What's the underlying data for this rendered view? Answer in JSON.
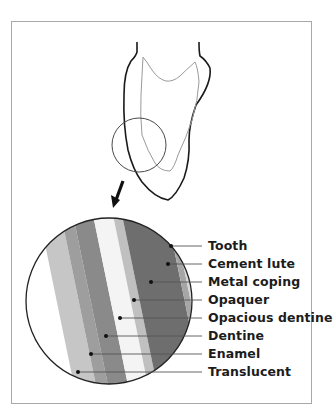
{
  "figure": {
    "colors": {
      "frame": "#a8a8a8",
      "tooth_outline": "#1a1a1a",
      "inner_outline": "#9a9a9a",
      "magnifier": "#4a4a4a",
      "white": "#ffffff",
      "light_gray": "#c6c6c6",
      "mid_gray": "#9e9e9e",
      "medium_dark_gray": "#8a8a8a",
      "dark_gray": "#6e6e6e",
      "label_text": "#1c1c1c"
    },
    "labels": [
      {
        "text": "Tooth",
        "dot": [
          171,
          246
        ],
        "y": 246
      },
      {
        "text": "Cement lute",
        "dot": [
          168,
          264
        ],
        "y": 264
      },
      {
        "text": "Metal coping",
        "dot": [
          151,
          282
        ],
        "y": 282
      },
      {
        "text": "Opaquer",
        "dot": [
          134,
          300
        ],
        "y": 300
      },
      {
        "text": "Opacious dentine",
        "dot": [
          120,
          318
        ],
        "y": 318
      },
      {
        "text": "Dentine",
        "dot": [
          106,
          336
        ],
        "y": 336
      },
      {
        "text": "Enamel",
        "dot": [
          91,
          354
        ],
        "y": 354
      },
      {
        "text": "Translucent",
        "dot": [
          78,
          372
        ],
        "y": 372
      }
    ]
  }
}
